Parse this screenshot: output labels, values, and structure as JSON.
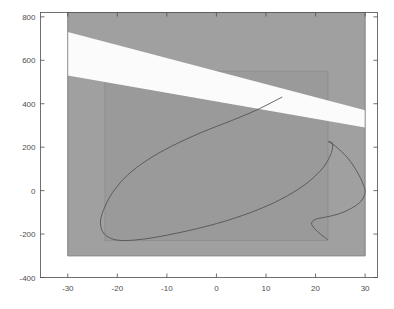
{
  "figure": {
    "background": "#ffffff",
    "width": 394,
    "height": 309
  },
  "chart_data": {
    "type": "area",
    "title": "",
    "subtitle": "",
    "xlabel": "",
    "ylabel": "",
    "xlim": [
      -35.5,
      32.5
    ],
    "ylim": [
      -400,
      820
    ],
    "grid": false,
    "legend": null,
    "xticks": [
      -30,
      -20,
      -10,
      0,
      10,
      20,
      30
    ],
    "xticklabels": [
      "-30",
      "-20",
      "-10",
      "0",
      "10",
      "20",
      "30"
    ],
    "yticks": [
      -400,
      -200,
      0,
      200,
      400,
      600,
      800
    ],
    "yticklabels": [
      "-400",
      "-200",
      "0",
      "200",
      "400",
      "600",
      "800"
    ],
    "colors": {
      "region_fill": "#a0a0a0",
      "region_edge": "#8c8c8c",
      "band_fill": "#fbfbfb",
      "curve": "#555555",
      "axis": "#4d4d4d",
      "tick_label": "#4d4d4d",
      "plot_background": "#ffffff"
    },
    "regions": [
      {
        "name": "outer-feasible-region",
        "fill": "#a0a0a0",
        "polygon": [
          [
            -30,
            820
          ],
          [
            30,
            820
          ],
          [
            30,
            -300
          ],
          [
            -30,
            -300
          ]
        ]
      },
      {
        "name": "inner-feasible-region",
        "fill": "#9a9a9a",
        "polygon": [
          [
            -22.5,
            550
          ],
          [
            22.5,
            550
          ],
          [
            22.5,
            -230
          ],
          [
            -22.5,
            -230
          ]
        ]
      },
      {
        "name": "diagonal-exclusion-band",
        "fill": "#fbfbfb",
        "polygon": [
          [
            -30,
            730
          ],
          [
            30,
            370
          ],
          [
            30,
            290
          ],
          [
            -30,
            530
          ]
        ]
      }
    ],
    "curve": {
      "name": "constraint-curve",
      "color": "#555555",
      "width": 0.9,
      "points": [
        [
          13.2,
          430
        ],
        [
          8.0,
          370
        ],
        [
          3.0,
          322
        ],
        [
          -3.0,
          268
        ],
        [
          -9.0,
          205
        ],
        [
          -14.0,
          140
        ],
        [
          -18.0,
          70
        ],
        [
          -21.0,
          -10
        ],
        [
          -22.8,
          -90
        ],
        [
          -23.4,
          -150
        ],
        [
          -22.6,
          -200
        ],
        [
          -20.0,
          -228
        ],
        [
          -15.0,
          -224
        ],
        [
          -8.0,
          -196
        ],
        [
          0.0,
          -152
        ],
        [
          7.0,
          -100
        ],
        [
          13.0,
          -40
        ],
        [
          18.0,
          30
        ],
        [
          21.5,
          105
        ],
        [
          23.2,
          175
        ],
        [
          23.4,
          218
        ],
        [
          22.6,
          225
        ],
        [
          24.0,
          205
        ],
        [
          26.5,
          150
        ],
        [
          28.4,
          86
        ],
        [
          29.6,
          30
        ],
        [
          30.0,
          -8
        ],
        [
          29.2,
          -48
        ],
        [
          27.2,
          -82
        ],
        [
          24.6,
          -108
        ],
        [
          22.0,
          -122
        ],
        [
          20.0,
          -132
        ],
        [
          19.2,
          -150
        ],
        [
          19.8,
          -175
        ],
        [
          21.0,
          -200
        ],
        [
          22.4,
          -225
        ]
      ]
    }
  }
}
